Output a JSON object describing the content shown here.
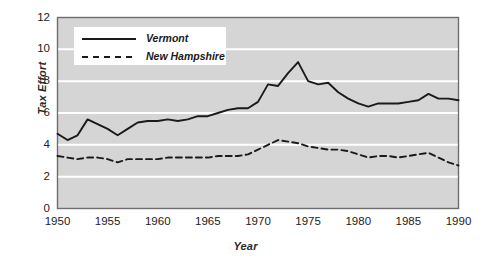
{
  "chart_data": {
    "type": "line",
    "title": "",
    "xlabel": "Year",
    "ylabel": "Tax Effort",
    "xlim": [
      1950,
      1990
    ],
    "ylim": [
      0,
      12
    ],
    "xticks": [
      "1950",
      "1955",
      "1960",
      "1965",
      "1970",
      "1975",
      "1980",
      "1985",
      "1990"
    ],
    "xtick_values": [
      1950,
      1955,
      1960,
      1965,
      1970,
      1975,
      1980,
      1985,
      1990
    ],
    "yticks": [
      "0",
      "2",
      "4",
      "6",
      "8",
      "10",
      "12"
    ],
    "ytick_values": [
      0,
      2,
      4,
      6,
      8,
      10,
      12
    ],
    "grid": "horizontal-white-on-gray",
    "legend_position": "top-left-inside",
    "plot_bgcolor": "#d5d5d5",
    "grid_color": "#ffffff",
    "line_color": "#1a1a1a",
    "x": [
      1950,
      1951,
      1952,
      1953,
      1954,
      1955,
      1956,
      1957,
      1958,
      1959,
      1960,
      1961,
      1962,
      1963,
      1964,
      1965,
      1966,
      1967,
      1968,
      1969,
      1970,
      1971,
      1972,
      1973,
      1974,
      1975,
      1976,
      1977,
      1978,
      1979,
      1980,
      1981,
      1982,
      1983,
      1984,
      1985,
      1986,
      1987,
      1988,
      1989,
      1990
    ],
    "series": [
      {
        "name": "Vermont",
        "style": "solid",
        "values": [
          4.7,
          4.3,
          4.6,
          5.6,
          5.3,
          5.0,
          4.6,
          5.0,
          5.4,
          5.5,
          5.5,
          5.6,
          5.5,
          5.6,
          5.8,
          5.8,
          6.0,
          6.2,
          6.3,
          6.3,
          6.7,
          7.8,
          7.7,
          8.5,
          9.2,
          8.0,
          7.8,
          7.9,
          7.3,
          6.9,
          6.6,
          6.4,
          6.6,
          6.6,
          6.6,
          6.7,
          6.8,
          7.2,
          6.9,
          6.9,
          6.8
        ]
      },
      {
        "name": "New Hampshire",
        "style": "dashed",
        "values": [
          3.3,
          3.2,
          3.1,
          3.2,
          3.2,
          3.1,
          2.9,
          3.1,
          3.1,
          3.1,
          3.1,
          3.2,
          3.2,
          3.2,
          3.2,
          3.2,
          3.3,
          3.3,
          3.3,
          3.4,
          3.7,
          4.0,
          4.3,
          4.2,
          4.1,
          3.9,
          3.8,
          3.7,
          3.7,
          3.6,
          3.4,
          3.2,
          3.3,
          3.3,
          3.2,
          3.3,
          3.4,
          3.5,
          3.2,
          2.9,
          2.7
        ]
      }
    ]
  },
  "legend": {
    "items": [
      {
        "label": "Vermont",
        "style": "solid"
      },
      {
        "label": "New Hampshire",
        "style": "dashed"
      }
    ]
  }
}
